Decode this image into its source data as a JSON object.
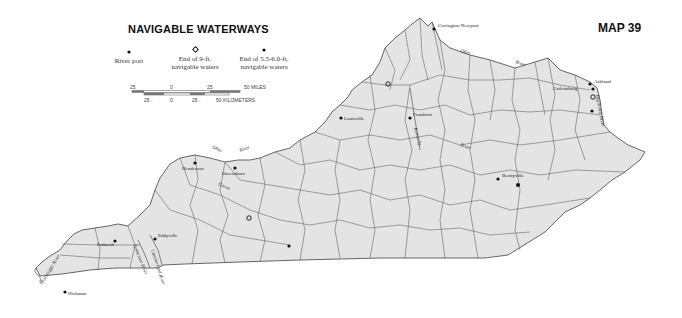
{
  "title": "NAVIGABLE WATERWAYS",
  "map_number": "MAP 39",
  "legend": {
    "items": [
      {
        "symbol": "dot",
        "label_line1": "River port",
        "label_line2": ""
      },
      {
        "symbol": "star-circle",
        "label_line1": "End of 9-ft.",
        "label_line2": "navigable waters"
      },
      {
        "symbol": "dot",
        "label_line1": "End of 5.5-6.0-ft.",
        "label_line2": "navigable waters"
      }
    ]
  },
  "scale_bar": {
    "miles_ticks": [
      "25",
      "0",
      "25",
      "50 MILES"
    ],
    "km_ticks": [
      "25",
      "0",
      "25",
      "50 KILOMETERS"
    ]
  },
  "colors": {
    "land_fill": "#e4e4e4",
    "border": "#555555",
    "text": "#222222"
  },
  "cities": [
    {
      "name": "Covington-Newport"
    },
    {
      "name": "Louisville"
    },
    {
      "name": "Frankfort"
    },
    {
      "name": "Ashland"
    },
    {
      "name": "Catlettsburg"
    },
    {
      "name": "Owensboro"
    },
    {
      "name": "Henderson"
    },
    {
      "name": "Beattyville"
    },
    {
      "name": "Paducah"
    },
    {
      "name": "Eddyville"
    },
    {
      "name": "Hickman"
    }
  ],
  "rivers": [
    {
      "name": "Ohio"
    },
    {
      "name": "River"
    },
    {
      "name": "Ohio"
    },
    {
      "name": "River"
    },
    {
      "name": "Kentucky"
    },
    {
      "name": "River"
    },
    {
      "name": "Green"
    },
    {
      "name": "Big Sandy River"
    },
    {
      "name": "Mississippi River"
    },
    {
      "name": "Tennessee River"
    },
    {
      "name": "Cumberland River"
    }
  ]
}
